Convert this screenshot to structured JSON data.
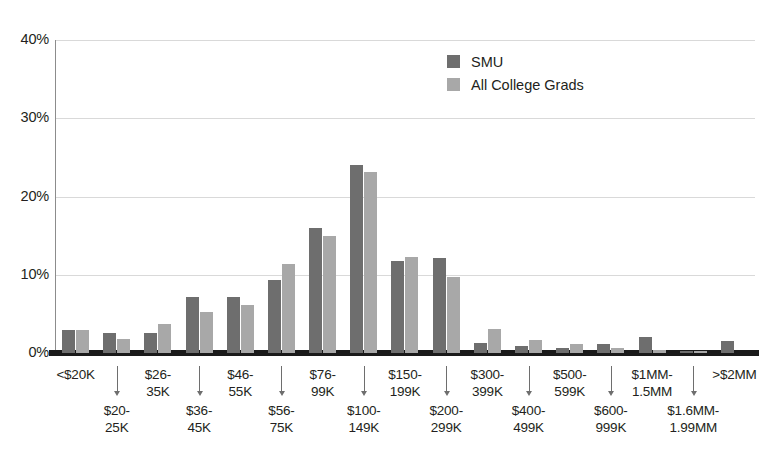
{
  "chart_data": {
    "type": "bar",
    "title": "",
    "subtitle": "",
    "xlabel": "",
    "ylabel": "",
    "ylim": [
      0,
      40
    ],
    "y_unit": "%",
    "grid": true,
    "legend_position": "top-center-right",
    "y_ticks": [
      "0%",
      "10%",
      "20%",
      "30%",
      "40%"
    ],
    "y_tick_values": [
      0,
      10,
      20,
      30,
      40
    ],
    "categories": [
      "<$20K",
      "$20-25K",
      "$26-35K",
      "$36-45K",
      "$46-55K",
      "$56-75K",
      "$76-99K",
      "$100-149K",
      "$150-199K",
      "$200-299K",
      "$300-399K",
      "$400-499K",
      "$500-599K",
      "$600-999K",
      "$1MM-1.5MM",
      "$1.6MM-1.99MM",
      ">$2MM"
    ],
    "category_lines": [
      [
        "<$20K"
      ],
      [
        "$20-",
        "25K"
      ],
      [
        "$26-",
        "35K"
      ],
      [
        "$36-",
        "45K"
      ],
      [
        "$46-",
        "55K"
      ],
      [
        "$56-",
        "75K"
      ],
      [
        "$76-",
        "99K"
      ],
      [
        "$100-",
        "149K"
      ],
      [
        "$150-",
        "199K"
      ],
      [
        "$200-",
        "299K"
      ],
      [
        "$300-",
        "399K"
      ],
      [
        "$400-",
        "499K"
      ],
      [
        "$500-",
        "599K"
      ],
      [
        "$600-",
        "999K"
      ],
      [
        "$1MM-",
        "1.5MM"
      ],
      [
        "$1.6MM-",
        "1.99MM"
      ],
      [
        ">$2MM"
      ]
    ],
    "series": [
      {
        "name": "SMU",
        "color": "#6e6e6e",
        "values": [
          3.0,
          2.6,
          2.5,
          7.1,
          7.1,
          9.3,
          16.0,
          24.0,
          11.8,
          12.2,
          1.3,
          0.9,
          0.6,
          1.2,
          2.0,
          0.2,
          1.5
        ]
      },
      {
        "name": "All College Grads",
        "color": "#a8a8a8",
        "values": [
          3.0,
          1.8,
          3.7,
          5.2,
          6.2,
          11.4,
          15.0,
          23.1,
          12.3,
          9.7,
          3.1,
          1.6,
          1.1,
          0.7,
          0.4,
          0.2,
          0.0
        ]
      }
    ]
  },
  "legend": {
    "items": [
      {
        "label": "SMU",
        "color": "#6e6e6e"
      },
      {
        "label": "All College Grads",
        "color": "#a8a8a8"
      }
    ]
  },
  "colors": {
    "smu": "#6e6e6e",
    "all_college_grads": "#a8a8a8",
    "gridline": "#d9d9d9",
    "axis": "#1a1a1a",
    "text": "#231f20",
    "background": "#ffffff"
  }
}
